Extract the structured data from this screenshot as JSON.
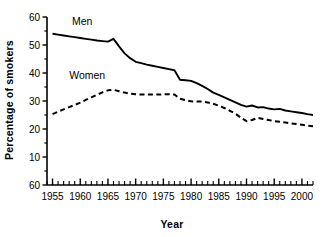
{
  "chart_data": {
    "type": "line",
    "title": "",
    "xlabel": "Year",
    "ylabel": "Percentage of smokers",
    "xlim": [
      1954,
      2002
    ],
    "ylim": [
      0,
      60
    ],
    "grid": false,
    "legend_position": "inline-labels",
    "y_tick_labels": [
      "60",
      "50",
      "40",
      "30",
      "20",
      "10",
      "60"
    ],
    "y_tick_values": [
      60,
      50,
      40,
      30,
      20,
      10,
      0
    ],
    "y_axis_note": "Bottom-most tick is printed as 60 in the original figure although it sits at the 0 position",
    "x_tick_labels": [
      "1955",
      "1960",
      "1965",
      "1970",
      "1975",
      "1980",
      "1985",
      "1990",
      "1995",
      "2000"
    ],
    "x_tick_values": [
      1955,
      1960,
      1965,
      1970,
      1975,
      1980,
      1985,
      1990,
      1995,
      2000
    ],
    "x_minor_tick_interval": 1,
    "series": [
      {
        "name": "Men",
        "style": "solid",
        "color": "#000000",
        "x": [
          1955,
          1956,
          1957,
          1958,
          1959,
          1960,
          1961,
          1962,
          1963,
          1964,
          1965,
          1966,
          1967,
          1968,
          1969,
          1970,
          1971,
          1972,
          1973,
          1974,
          1975,
          1976,
          1977,
          1978,
          1979,
          1980,
          1981,
          1982,
          1983,
          1984,
          1985,
          1986,
          1987,
          1988,
          1989,
          1990,
          1991,
          1992,
          1993,
          1994,
          1995,
          1996,
          1997,
          1998,
          1999,
          2000,
          2001,
          2002
        ],
        "values": [
          54.0,
          53.7,
          53.4,
          53.1,
          52.8,
          52.5,
          52.2,
          51.9,
          51.6,
          51.4,
          51.2,
          52.2,
          49.5,
          47.0,
          45.3,
          44.0,
          43.5,
          43.0,
          42.6,
          42.2,
          41.8,
          41.4,
          41.0,
          37.6,
          37.4,
          37.2,
          36.4,
          35.4,
          34.3,
          33.0,
          32.2,
          31.3,
          30.4,
          29.5,
          28.6,
          28.0,
          28.4,
          27.7,
          27.8,
          27.3,
          27.0,
          27.2,
          26.6,
          26.3,
          26.0,
          25.7,
          25.3,
          25.0
        ]
      },
      {
        "name": "Women",
        "style": "dashed",
        "color": "#000000",
        "x": [
          1955,
          1956,
          1957,
          1958,
          1959,
          1960,
          1961,
          1962,
          1963,
          1964,
          1965,
          1966,
          1967,
          1968,
          1969,
          1970,
          1971,
          1972,
          1973,
          1974,
          1975,
          1976,
          1977,
          1978,
          1979,
          1980,
          1981,
          1982,
          1983,
          1984,
          1985,
          1986,
          1987,
          1988,
          1989,
          1990,
          1991,
          1992,
          1993,
          1994,
          1995,
          1996,
          1997,
          1998,
          1999,
          2000,
          2001,
          2002
        ],
        "values": [
          25.3,
          26.2,
          27.0,
          27.8,
          28.6,
          29.4,
          30.4,
          31.3,
          32.2,
          33.1,
          33.8,
          34.0,
          33.5,
          33.0,
          32.6,
          32.4,
          32.3,
          32.3,
          32.3,
          32.3,
          32.4,
          32.4,
          32.3,
          30.8,
          30.3,
          29.9,
          29.8,
          29.8,
          29.5,
          29.0,
          28.3,
          27.5,
          26.5,
          25.5,
          24.0,
          22.8,
          23.2,
          24.0,
          23.6,
          23.2,
          22.8,
          22.6,
          22.3,
          22.0,
          21.8,
          21.5,
          21.2,
          21.0
        ]
      }
    ],
    "annotations": [
      {
        "text": "Men",
        "x": 1958.5,
        "y": 57.0
      },
      {
        "text": "Women",
        "x": 1958.0,
        "y": 38.0
      }
    ]
  }
}
